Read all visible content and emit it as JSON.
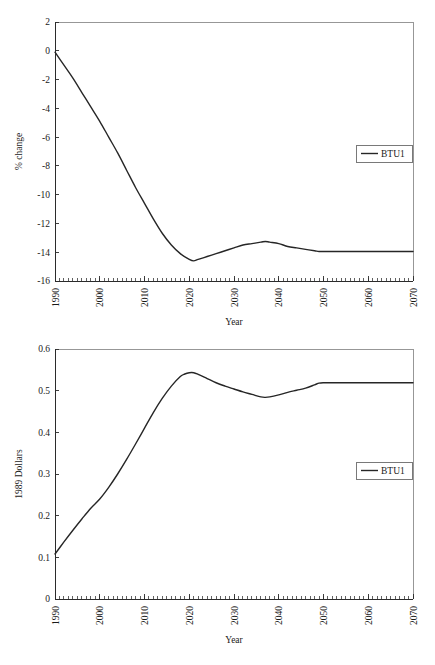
{
  "chart_data": [
    {
      "id": "top",
      "type": "line",
      "title": "",
      "xlabel": "Year",
      "ylabel": "% change",
      "xlim": [
        1990,
        2070
      ],
      "ylim": [
        -16,
        2
      ],
      "xticks": [
        1990,
        2000,
        2010,
        2020,
        2030,
        2040,
        2050,
        2060,
        2070
      ],
      "xtick_labels": [
        "1990",
        "2000",
        "2010",
        "2020",
        "2030",
        "2040",
        "2050",
        "2060",
        "2070"
      ],
      "yticks": [
        2,
        0,
        -2,
        -4,
        -6,
        -8,
        -10,
        -12,
        -14,
        -16
      ],
      "ytick_labels": [
        "2",
        "0",
        "-2",
        "-4",
        "-6",
        "-8",
        "-10",
        "-12",
        "-14",
        "-16"
      ],
      "minor_tick_interval": 1,
      "grid": false,
      "legend_position": "center-right",
      "series": [
        {
          "name": "BTU1",
          "color": "#262626",
          "x": [
            1990,
            1992,
            1994,
            1996,
            1998,
            2000,
            2002,
            2004,
            2006,
            2008,
            2010,
            2012,
            2014,
            2016,
            2018,
            2020,
            2021,
            2022,
            2024,
            2026,
            2028,
            2030,
            2032,
            2034,
            2036,
            2037,
            2038,
            2040,
            2042,
            2044,
            2046,
            2048,
            2049,
            2050,
            2052,
            2055,
            2060,
            2065,
            2070
          ],
          "values": [
            -0.1,
            -1.0,
            -1.9,
            -2.9,
            -3.9,
            -4.9,
            -6.0,
            -7.1,
            -8.3,
            -9.5,
            -10.6,
            -11.7,
            -12.7,
            -13.5,
            -14.1,
            -14.5,
            -14.6,
            -14.5,
            -14.3,
            -14.1,
            -13.9,
            -13.7,
            -13.5,
            -13.4,
            -13.3,
            -13.25,
            -13.3,
            -13.4,
            -13.6,
            -13.7,
            -13.8,
            -13.9,
            -13.95,
            -13.95,
            -13.95,
            -13.95,
            -13.95,
            -13.95,
            -13.95
          ]
        }
      ]
    },
    {
      "id": "bottom",
      "type": "line",
      "title": "",
      "xlabel": "Year",
      "ylabel": "1989 Dollars",
      "xlim": [
        1990,
        2070
      ],
      "ylim": [
        0,
        0.6
      ],
      "xticks": [
        1990,
        2000,
        2010,
        2020,
        2030,
        2040,
        2050,
        2060,
        2070
      ],
      "xtick_labels": [
        "1990",
        "2000",
        "2010",
        "2020",
        "2030",
        "2040",
        "2050",
        "2060",
        "2070"
      ],
      "yticks": [
        0.6,
        0.5,
        0.4,
        0.3,
        0.2,
        0.1,
        0
      ],
      "ytick_labels": [
        "0.6",
        "0.5",
        "0.4",
        "0.3",
        "0.2",
        "0.1",
        "0"
      ],
      "minor_tick_interval": 1,
      "grid": false,
      "legend_position": "center-right",
      "series": [
        {
          "name": "BTU1",
          "color": "#262626",
          "x": [
            1990,
            1992,
            1994,
            1996,
            1998,
            2000,
            2002,
            2004,
            2006,
            2008,
            2010,
            2012,
            2014,
            2016,
            2018,
            2019,
            2020,
            2021,
            2022,
            2024,
            2026,
            2028,
            2030,
            2032,
            2034,
            2036,
            2037,
            2038,
            2040,
            2042,
            2044,
            2046,
            2048,
            2049,
            2050,
            2052,
            2055,
            2060,
            2065,
            2070
          ],
          "values": [
            0.108,
            0.137,
            0.165,
            0.192,
            0.218,
            0.24,
            0.268,
            0.3,
            0.335,
            0.372,
            0.41,
            0.448,
            0.482,
            0.511,
            0.534,
            0.54,
            0.543,
            0.543,
            0.539,
            0.529,
            0.519,
            0.511,
            0.504,
            0.497,
            0.491,
            0.485,
            0.484,
            0.485,
            0.49,
            0.496,
            0.501,
            0.506,
            0.514,
            0.518,
            0.519,
            0.519,
            0.519,
            0.519,
            0.519,
            0.519
          ]
        }
      ]
    }
  ],
  "legend": {
    "entry_label": "BTU1"
  }
}
